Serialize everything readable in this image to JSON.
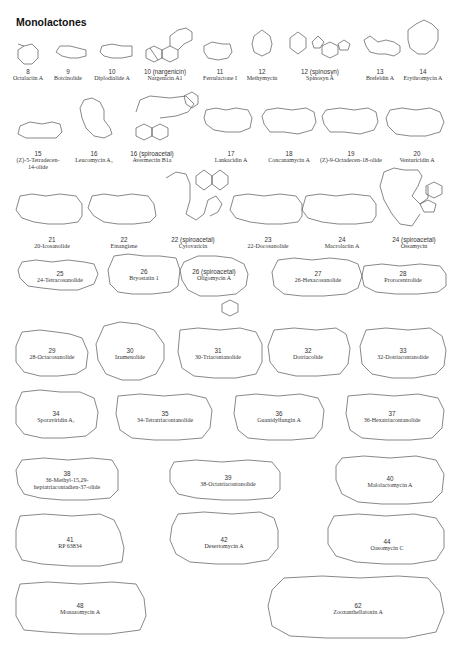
{
  "figure": {
    "title": "Monolactones"
  },
  "compounds": [
    {
      "id": "c8",
      "number": "8",
      "name": "Octalactin A",
      "x": 28,
      "y": 68
    },
    {
      "id": "c9",
      "number": "9",
      "name": "Botcinolide",
      "x": 68,
      "y": 68
    },
    {
      "id": "c10",
      "number": "10",
      "name": "Diplodialide A",
      "x": 110,
      "y": 68
    },
    {
      "id": "c10n",
      "number": "10 (nargenicin)",
      "name": "Nargenicin A1",
      "x": 163,
      "y": 68
    },
    {
      "id": "c11",
      "number": "11",
      "name": "Ferrulactone I",
      "x": 221,
      "y": 68
    },
    {
      "id": "c12m",
      "number": "12",
      "name": "Methymycin",
      "x": 262,
      "y": 68
    },
    {
      "id": "c12s",
      "number": "12 (spinosyn)",
      "name": "Spinosyn A",
      "x": 320,
      "y": 68
    },
    {
      "id": "c13",
      "number": "13",
      "name": "Brefeldin A",
      "x": 379,
      "y": 68
    },
    {
      "id": "c14",
      "number": "14",
      "name": "Erythromycin A",
      "x": 423,
      "y": 68
    },
    {
      "id": "c15",
      "number": "15",
      "name": "(Z)-5-Tetradecen-14-olide",
      "x": 32,
      "y": 150,
      "name2": "14-olide",
      "name1": "(Z)-5-Tetradecen-"
    },
    {
      "id": "c16",
      "number": "16",
      "name": "Leucomycin A₃",
      "x": 95,
      "y": 150
    },
    {
      "id": "c16s",
      "number": "16 (spiroacetal)",
      "name": "Avermectin B1a",
      "x": 152,
      "y": 150
    },
    {
      "id": "c17",
      "number": "17",
      "name": "Lankacidin A",
      "x": 231,
      "y": 150
    },
    {
      "id": "c18",
      "number": "18",
      "name": "Concanamycin A",
      "x": 289,
      "y": 150
    },
    {
      "id": "c19",
      "number": "19",
      "name": "(Z)-9-Octadecen-18-olide",
      "x": 351,
      "y": 150
    },
    {
      "id": "c20",
      "number": "20",
      "name": "Venturicidin A",
      "x": 417,
      "y": 150
    },
    {
      "id": "c21",
      "number": "21",
      "name": "20-Icosanolide",
      "x": 52,
      "y": 236
    },
    {
      "id": "c22",
      "number": "22",
      "name": "Etnangiene",
      "x": 124,
      "y": 236
    },
    {
      "id": "c22s",
      "number": "22 (spiroacetal)",
      "name": "Cytovaricin",
      "x": 193,
      "y": 236
    },
    {
      "id": "c23",
      "number": "23",
      "name": "22-Docosanolide",
      "x": 271,
      "y": 236
    },
    {
      "id": "c24",
      "number": "24",
      "name": "Macrolactin A",
      "x": 342,
      "y": 236
    },
    {
      "id": "c24s",
      "number": "24 (spiroacetal)",
      "name": "Ossamycin",
      "x": 417,
      "y": 236
    },
    {
      "id": "c25",
      "number": "25",
      "name": "24-Tetracosanolide",
      "x": 60,
      "y": 272
    },
    {
      "id": "c26",
      "number": "26",
      "name": "Bryostatin 1",
      "x": 129,
      "y": 272
    },
    {
      "id": "c26s",
      "number": "26 (spiroacetal)",
      "name": "Oligomycin A",
      "x": 215,
      "y": 272
    },
    {
      "id": "c27",
      "number": "27",
      "name": "26-Hexacosanolide",
      "x": 321,
      "y": 272
    },
    {
      "id": "c28",
      "number": "28",
      "name": "Prorocentrolide",
      "x": 403,
      "y": 272
    },
    {
      "id": "c29",
      "number": "29",
      "name": "28-Octacosanolide",
      "x": 52,
      "y": 349
    },
    {
      "id": "c30",
      "number": "30",
      "name": "Izumenolide",
      "x": 130,
      "y": 349
    },
    {
      "id": "c31",
      "number": "31",
      "name": "30-Triacontanolide",
      "x": 218,
      "y": 349
    },
    {
      "id": "c32",
      "number": "32",
      "name": "Dotriacolide",
      "x": 308,
      "y": 349
    },
    {
      "id": "c33",
      "number": "33",
      "name": "32-Dotriacontanolide",
      "x": 403,
      "y": 349
    },
    {
      "id": "c34",
      "number": "34",
      "name": "Sporaviridin A₁",
      "x": 52,
      "y": 413
    },
    {
      "id": "c35",
      "number": "35",
      "name": "34-Tetratriacontanolide",
      "x": 165,
      "y": 413
    },
    {
      "id": "c36",
      "number": "36",
      "name": "Guanidylfungin A",
      "x": 276,
      "y": 413
    },
    {
      "id": "c37",
      "number": "37",
      "name": "36-Hexatriacontanolide",
      "x": 392,
      "y": 413
    },
    {
      "id": "c38",
      "number": "38",
      "name": "36-Methyl-15,29-",
      "name_line2": "heptatriacontadien-37-olide",
      "x": 67,
      "y": 480
    },
    {
      "id": "c39",
      "number": "39",
      "name": "38-Octatriacontanolide",
      "x": 238,
      "y": 480
    },
    {
      "id": "c40",
      "number": "40",
      "name": "Malolactomycin A",
      "x": 390,
      "y": 476
    },
    {
      "id": "c41",
      "number": "41",
      "name": "RP 63834",
      "x": 70,
      "y": 538
    },
    {
      "id": "c42",
      "number": "42",
      "name": "Desertomycin A",
      "x": 243,
      "y": 538
    },
    {
      "id": "c44",
      "number": "44",
      "name": "Oasomycin C",
      "x": 391,
      "y": 544
    },
    {
      "id": "c48",
      "number": "48",
      "name": "Monazomycin A",
      "x": 80,
      "y": 604
    },
    {
      "id": "c62",
      "number": "62",
      "name": "Zooxanthellatoxin A",
      "x": 360,
      "y": 604
    }
  ]
}
